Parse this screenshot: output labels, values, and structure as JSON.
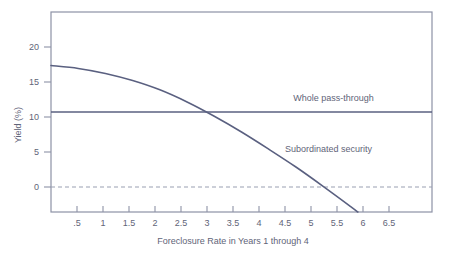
{
  "chart_data": {
    "type": "line",
    "title": "",
    "subtitle": "",
    "xlabel": "Foreclosure Rate in Years 1 through 4",
    "ylabel": "Yield (%)",
    "xlim": [
      0,
      7
    ],
    "ylim": [
      -4,
      24
    ],
    "grid": false,
    "legend_position": "inline-annotations",
    "x_ticks": [
      ".5",
      "1",
      "1.5",
      "2",
      "2.5",
      "3",
      "3.5",
      "4",
      "4.5",
      "5",
      "5.5",
      "6",
      "6.5"
    ],
    "x_tick_values": [
      0.5,
      1,
      1.5,
      2,
      2.5,
      3,
      3.5,
      4,
      4.5,
      5,
      5.5,
      6,
      6.5
    ],
    "y_ticks": [
      "0",
      "5",
      "10",
      "15",
      "20"
    ],
    "y_tick_values": [
      0,
      5,
      10,
      15,
      20
    ],
    "colors": {
      "line": "#5a6080",
      "axis": "#8d92a6",
      "text": "#5f6478",
      "zero_line": "#9aa0b2",
      "background": "#ffffff"
    },
    "series": [
      {
        "name": "Whole pass-through",
        "style": "solid",
        "label_x": 4.45,
        "label_y": 11.6,
        "x": [
          0,
          7
        ],
        "values": [
          10,
          10
        ]
      },
      {
        "name": "Subordinated security",
        "style": "solid",
        "label_x": 4.3,
        "label_y": 4.4,
        "x": [
          0,
          0.5,
          1,
          1.5,
          2,
          2.5,
          3,
          3.5,
          4,
          4.5,
          5,
          5.5,
          6
        ],
        "values": [
          16.5,
          16.1,
          15.4,
          14.4,
          13.1,
          11.4,
          9.4,
          7.2,
          4.8,
          2.3,
          -0.4,
          -3.2,
          -6.1
        ]
      }
    ],
    "annotations": [
      {
        "text": "Whole pass-through",
        "x": 4.45,
        "y": 11.6
      },
      {
        "text": "Subordinated security",
        "x": 4.3,
        "y": 4.4
      }
    ],
    "zero_reference_line": {
      "value": 0,
      "style": "dashed"
    }
  }
}
